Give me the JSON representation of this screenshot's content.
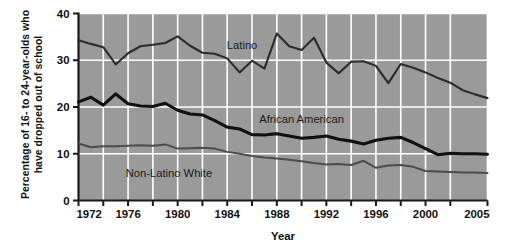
{
  "chart_data": {
    "type": "line",
    "title": "",
    "xlabel": "Year",
    "ylabel_line1": "Percentage of 16- to 24-year-olds who",
    "ylabel_line2": "have dropped out of school",
    "xlim": [
      1972,
      2005
    ],
    "ylim": [
      0,
      40
    ],
    "ytick_values": [
      0,
      10,
      20,
      30,
      40
    ],
    "ytick_labels": [
      "0",
      "10",
      "20",
      "30",
      "40"
    ],
    "xtick_values": [
      1972,
      1974,
      1976,
      1978,
      1980,
      1982,
      1984,
      1986,
      1988,
      1990,
      1992,
      1994,
      1996,
      1998,
      2000,
      2002,
      2005
    ],
    "xtick_labels": [
      "1972",
      "",
      "1976",
      "",
      "1980",
      "",
      "1984",
      "",
      "1988",
      "",
      "1992",
      "",
      "1996",
      "",
      "2000",
      "",
      "2005"
    ],
    "grid": true,
    "grid_color": "#ffffff",
    "plot_background": "#9a9a9a",
    "legend_position": "inline-annotations",
    "x": [
      1972,
      1973,
      1974,
      1975,
      1976,
      1977,
      1978,
      1979,
      1980,
      1981,
      1982,
      1983,
      1984,
      1985,
      1986,
      1987,
      1988,
      1989,
      1990,
      1991,
      1992,
      1993,
      1994,
      1995,
      1996,
      1997,
      1998,
      1999,
      2000,
      2001,
      2002,
      2003,
      2004,
      2005
    ],
    "series": [
      {
        "name": "Latino",
        "color": "#2b2b2b",
        "line_width": 2.1,
        "label_x": 1985.2,
        "label_y": 32.4,
        "values": [
          34.3,
          33.5,
          32.8,
          29.1,
          31.5,
          33.0,
          33.3,
          33.7,
          35.1,
          33.1,
          31.6,
          31.4,
          30.4,
          27.4,
          29.9,
          28.2,
          35.7,
          33.0,
          32.2,
          34.8,
          29.5,
          27.2,
          29.7,
          29.8,
          28.8,
          25.1,
          29.2,
          28.4,
          27.4,
          26.2,
          25.2,
          23.6,
          22.7,
          21.9
        ]
      },
      {
        "name": "African American",
        "color": "#111111",
        "line_width": 3.1,
        "label_x": 1990.0,
        "label_y": 16.5,
        "values": [
          21.1,
          22.1,
          20.4,
          22.8,
          20.7,
          20.2,
          20.1,
          20.8,
          19.3,
          18.5,
          18.3,
          17.1,
          15.7,
          15.3,
          14.1,
          14.0,
          14.3,
          13.8,
          13.3,
          13.5,
          13.8,
          13.1,
          12.7,
          12.1,
          12.9,
          13.3,
          13.5,
          12.4,
          11.1,
          9.8,
          10.1,
          10.0,
          10.0,
          9.9
        ]
      },
      {
        "name": "Non-Latino White",
        "color": "#4c4c4c",
        "line_width": 2.0,
        "label_x": 1979.3,
        "label_y": 5.0,
        "values": [
          12.2,
          11.4,
          11.6,
          11.6,
          11.7,
          11.8,
          11.7,
          12.0,
          11.1,
          11.2,
          11.3,
          11.1,
          10.4,
          10.0,
          9.5,
          9.2,
          9.0,
          8.7,
          8.4,
          8.0,
          7.7,
          7.8,
          7.6,
          8.5,
          7.0,
          7.5,
          7.6,
          7.2,
          6.3,
          6.2,
          6.1,
          6.0,
          6.0,
          5.9
        ]
      }
    ]
  }
}
